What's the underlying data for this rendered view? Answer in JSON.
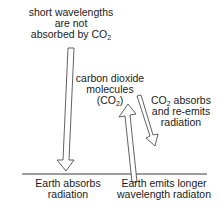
{
  "diagram": {
    "title": "",
    "labels": {
      "incoming": {
        "line1": "short wavelengths",
        "line2": "are not",
        "line3_prefix": "absorbed by CO",
        "line3_sub": "2"
      },
      "molecules": {
        "line1": "carbon dioxide",
        "line2": "molecules",
        "line3_prefix": "(CO",
        "line3_sub": "2",
        "line3_suffix": ")"
      },
      "reemit": {
        "line1_prefix": "CO",
        "line1_sub": "2",
        "line1_suffix": " absorbs",
        "line2": "and re-emits",
        "line3": "radiation"
      },
      "earth_absorbs": {
        "line1": "Earth absorbs",
        "line2": "radiation"
      },
      "earth_emits": {
        "line1": "Earth emits longer",
        "line2": "wavelength radiaton"
      }
    },
    "arrows": [
      {
        "id": "incoming-short-wave",
        "direction": "down",
        "meaning": "short wavelengths pass through to Earth"
      },
      {
        "id": "earth-emission",
        "direction": "up",
        "meaning": "Earth emits longer wavelength radiation"
      },
      {
        "id": "co2-reemission",
        "direction": "down",
        "meaning": "CO2 absorbs and re-emits radiation"
      }
    ],
    "colors": {
      "stroke": "#3a3a3a",
      "text": "#1a1a1a",
      "background": "#ffffff"
    }
  }
}
